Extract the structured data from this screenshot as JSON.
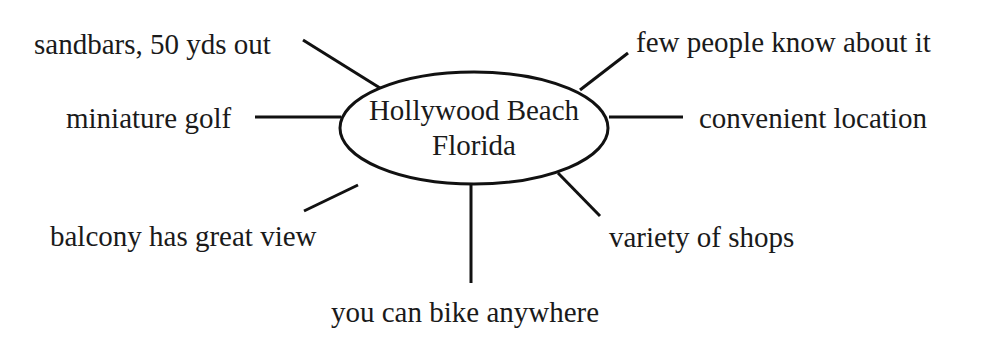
{
  "diagram": {
    "type": "cluster-map",
    "center": {
      "line1": "Hollywood Beach",
      "line2": "Florida"
    },
    "nodes": [
      {
        "id": "sandbars",
        "label": "sandbars, 50 yds out",
        "position": "upper-left"
      },
      {
        "id": "few-people",
        "label": "few people know about it",
        "position": "upper-right"
      },
      {
        "id": "mini-golf",
        "label": "miniature golf",
        "position": "left"
      },
      {
        "id": "convenient",
        "label": "convenient location",
        "position": "right"
      },
      {
        "id": "balcony",
        "label": "balcony has great view",
        "position": "lower-left"
      },
      {
        "id": "shops",
        "label": "variety of shops",
        "position": "lower-right"
      },
      {
        "id": "bike",
        "label": "you can bike anywhere",
        "position": "bottom"
      }
    ],
    "colors": {
      "line": "#111111",
      "text": "#1a1a1a",
      "background": "#ffffff"
    }
  }
}
